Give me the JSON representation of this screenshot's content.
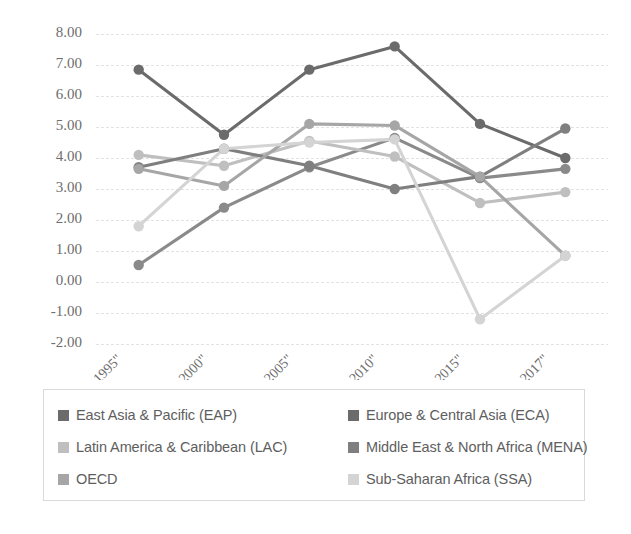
{
  "chart_data": {
    "type": "line",
    "title": "",
    "subtitle": "",
    "xlabel": "",
    "ylabel": "",
    "ylim": [
      -2,
      8
    ],
    "ytick_step": 1,
    "ytick_labels": [
      "8.00",
      "7.00",
      "6.00",
      "5.00",
      "4.00",
      "3.00",
      "2.00",
      "1.00",
      "0.00",
      "-1.00",
      "-2.00"
    ],
    "ytick_values": [
      8,
      7,
      6,
      5,
      4,
      3,
      2,
      1,
      0,
      -1,
      -2
    ],
    "grid": true,
    "grid_axis": "y",
    "legend_position": "bottom",
    "categories": [
      "\"1990-1995\"",
      "\"1995-2000\"",
      "\"2000-2005\"",
      "\"2005-2010\"",
      "\"2010-2015\"",
      "\"2015-2017\""
    ],
    "series": [
      {
        "name": "East Asia & Pacific (EAP)",
        "short": "EAP",
        "color": "#6b6b6b",
        "values": [
          6.85,
          4.75,
          6.85,
          7.6,
          5.1,
          4.0
        ]
      },
      {
        "name": "Europe & Central Asia (ECA)",
        "short": "ECA",
        "color": "#8a8a8a",
        "values": [
          0.55,
          2.4,
          3.7,
          4.65,
          3.35,
          3.65
        ]
      },
      {
        "name": "Latin America & Caribbean (LAC)",
        "short": "LAC",
        "color": "#bfbfbf",
        "values": [
          4.1,
          3.75,
          4.55,
          4.05,
          2.55,
          2.9
        ]
      },
      {
        "name": "Middle East & North Africa (MENA)",
        "short": "MENA",
        "color": "#7f7f7f",
        "values": [
          3.7,
          4.3,
          3.75,
          3.0,
          3.4,
          4.95
        ]
      },
      {
        "name": "OECD",
        "short": "OECD",
        "color": "#a6a6a6",
        "values": [
          3.65,
          3.1,
          5.1,
          5.05,
          3.4,
          0.85
        ]
      },
      {
        "name": "Sub-Saharan Africa (SSA)",
        "short": "SSA",
        "color": "#d4d4d4",
        "values": [
          1.8,
          4.3,
          4.5,
          4.6,
          -1.2,
          0.85
        ]
      }
    ]
  },
  "legend": {
    "entries": [
      {
        "label": "East Asia & Pacific (EAP)",
        "color": "#6b6b6b"
      },
      {
        "label": "Europe & Central Asia (ECA)",
        "color": "#6b6b6b"
      },
      {
        "label": "Latin America & Caribbean (LAC)",
        "color": "#bfbfbf"
      },
      {
        "label": "Middle East & North Africa (MENA)",
        "color": "#7f7f7f"
      },
      {
        "label": "OECD",
        "color": "#a6a6a6"
      },
      {
        "label": "Sub-Saharan Africa (SSA)",
        "color": "#d4d4d4"
      }
    ]
  }
}
